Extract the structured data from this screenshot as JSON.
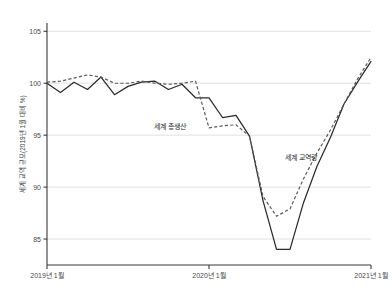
{
  "chart_data": {
    "type": "line",
    "title": "",
    "xlabel": "",
    "ylabel": "세계 교역 규모(2019년 1월 대비 %)",
    "ylim": [
      82.5,
      105.8
    ],
    "yticks": [
      85,
      90,
      95,
      100,
      105
    ],
    "ytick_labels": [
      "85",
      "90",
      "95",
      "100",
      "105"
    ],
    "xlim": [
      0,
      24
    ],
    "xticks": [
      0,
      12,
      24
    ],
    "xtick_labels": [
      "2019년 1월",
      "2020년 1월",
      "2021년 1월"
    ],
    "grid": true,
    "legend_position": "inline-annotation",
    "x": [
      0,
      1,
      2,
      3,
      4,
      5,
      6,
      7,
      8,
      9,
      10,
      11,
      12,
      13,
      14,
      15,
      16,
      17,
      18,
      19,
      20,
      21,
      22,
      23,
      24
    ],
    "series": [
      {
        "name": "세계 교역량",
        "style": "solid",
        "color": "#2b2b2b",
        "label_x": 18.8,
        "label_y": 92.6,
        "values": [
          100.0,
          99.1,
          100.1,
          99.4,
          100.6,
          98.9,
          99.7,
          100.1,
          100.2,
          99.4,
          99.9,
          98.6,
          98.6,
          96.7,
          96.9,
          94.9,
          88.7,
          84.0,
          84.0,
          88.5,
          92.0,
          94.8,
          98.0,
          100.1,
          102.1
        ]
      },
      {
        "name": "세계 총생산",
        "style": "dashed",
        "color": "#5a5a5a",
        "label_x": 9.1,
        "label_y": 95.6,
        "values": [
          100.1,
          100.2,
          100.5,
          100.8,
          100.6,
          100.0,
          100.0,
          100.2,
          100.0,
          99.9,
          100.0,
          100.2,
          95.7,
          95.9,
          96.0,
          94.9,
          89.1,
          87.2,
          87.9,
          90.8,
          93.3,
          95.5,
          98.0,
          100.4,
          102.5
        ]
      }
    ],
    "annotations": [
      {
        "text": "세계 총생산",
        "x": 9.1,
        "y": 95.6
      },
      {
        "text": "세계 교역량",
        "x": 18.8,
        "y": 92.6
      }
    ]
  },
  "layout": {
    "plot": {
      "left": 47,
      "right": 371,
      "top": 23,
      "bottom": 265
    },
    "colors": {
      "background": "#ffffff",
      "grid": "#d9d9d9",
      "axis": "#3a3a3a",
      "solid_series": "#2b2b2b",
      "dashed_series": "#5a5a5a",
      "text": "#4a4a4a"
    }
  }
}
